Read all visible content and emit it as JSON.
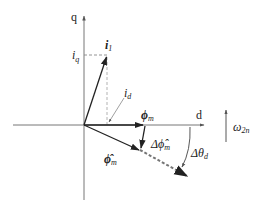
{
  "diagram": {
    "axes": {
      "q_label": "q",
      "d_label": "d"
    },
    "vectors": {
      "i1": {
        "label": "i",
        "subscript": "1"
      },
      "phi_m": {
        "label": "ϕ",
        "subscript": "m"
      },
      "phi_m_hat": {
        "label": "ϕ̂",
        "subscript": "m"
      },
      "delta_phi_m_hat": {
        "label": "Δϕ̂",
        "subscript": "m"
      }
    },
    "components": {
      "iq": {
        "label": "i",
        "subscript": "q"
      },
      "id": {
        "label": "i",
        "subscript": "d"
      }
    },
    "angle": {
      "label": "Δθ",
      "subscript": "d"
    },
    "rotation": {
      "label": "ω",
      "subscript": "2n"
    },
    "colors": {
      "axis": "#666666",
      "vector": "#222222",
      "dashed": "#888888"
    }
  }
}
